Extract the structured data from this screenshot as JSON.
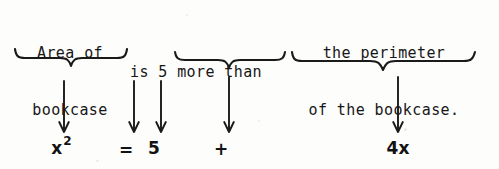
{
  "figure": {
    "kind": "word-problem-translation-diagram",
    "background_color": "#fdfdfc",
    "ink_color": "#141414",
    "width": 499,
    "height": 169
  },
  "phrases": {
    "area": {
      "line1": "Area of",
      "line2": "bookcase"
    },
    "connector": {
      "line1": "is 5 more than"
    },
    "perimeter": {
      "line1": "the perimeter",
      "line2": "of the bookcase."
    }
  },
  "braces": [
    {
      "name": "brace-under-area",
      "spans_phrase": "Area of bookcase",
      "width": 114
    },
    {
      "name": "brace-under-more-than",
      "spans_phrase": "more than",
      "width": 112
    },
    {
      "name": "brace-under-perimeter",
      "spans_phrase": "the perimeter of the bookcase.",
      "width": 186
    }
  ],
  "arrows": [
    {
      "name": "arrow-to-x-squared",
      "points_to": "x²"
    },
    {
      "name": "arrow-to-equals",
      "points_to": "="
    },
    {
      "name": "arrow-to-five",
      "points_to": "5"
    },
    {
      "name": "arrow-to-plus",
      "points_to": "+"
    },
    {
      "name": "arrow-to-four-x",
      "points_to": "4x"
    }
  ],
  "symbols": {
    "x_base": "x",
    "x_exponent": "2",
    "equals": "=",
    "five": "5",
    "plus": "+",
    "four_x": "4x"
  },
  "equation": {
    "full": "x² = 5 + 4x"
  }
}
